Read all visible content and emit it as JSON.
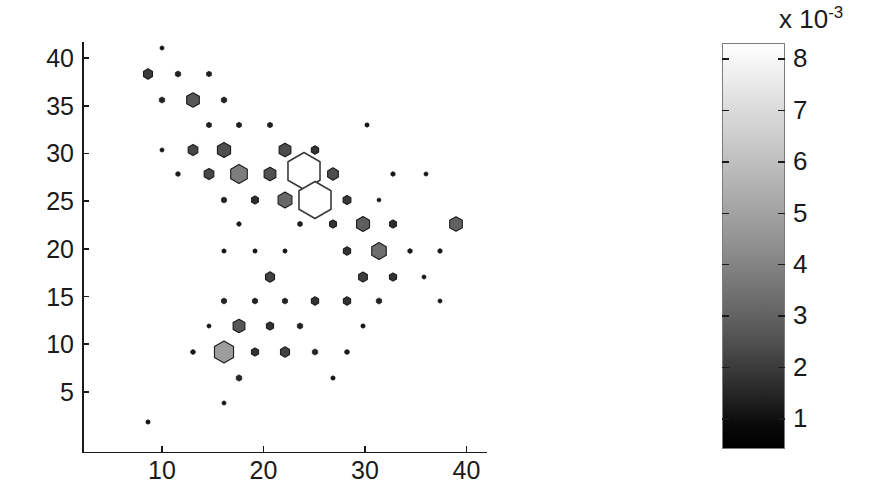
{
  "chart_data": {
    "type": "scatter",
    "subtype": "hexbin-density-scatter",
    "title": "",
    "xlabel": "",
    "ylabel": "",
    "xlim": [
      3.5,
      43.5
    ],
    "ylim": [
      1.5,
      41.5
    ],
    "xticks": [
      10,
      20,
      30,
      40
    ],
    "yticks": [
      5,
      10,
      15,
      20,
      25,
      30,
      35,
      40
    ],
    "grid": false,
    "legend": null,
    "marker": "hexagon",
    "value_units": "1e-3",
    "note": "Marker area encodes count/weight; marker gray level encodes density value from colorbar (black = low, white = high). Two largest bins are drawn as unfilled white hexagons with dark outline.",
    "colorbar": {
      "orientation": "vertical",
      "exponent_label": "x 10",
      "exponent_superscript": "-3",
      "ticks": [
        8,
        7,
        6,
        5,
        4,
        3,
        2,
        1
      ],
      "tick_labels": [
        "8",
        "7",
        "6",
        "5",
        "4",
        "3",
        "2",
        "1"
      ],
      "vmin": 0.4,
      "vmax": 8.3,
      "colormap": "gray",
      "low_color": "#000000",
      "high_color": "#ffffff"
    },
    "points": [
      {
        "x": 10.0,
        "y": 41.1,
        "r": 2.2,
        "v": 0.6
      },
      {
        "x": 8.6,
        "y": 38.3,
        "r": 5.2,
        "v": 1.6
      },
      {
        "x": 11.6,
        "y": 38.3,
        "r": 3.1,
        "v": 1.0
      },
      {
        "x": 14.6,
        "y": 38.3,
        "r": 2.8,
        "v": 0.9
      },
      {
        "x": 10.0,
        "y": 35.6,
        "r": 3.1,
        "v": 1.0
      },
      {
        "x": 13.1,
        "y": 35.6,
        "r": 7.3,
        "v": 2.4
      },
      {
        "x": 16.1,
        "y": 35.6,
        "r": 3.1,
        "v": 1.0
      },
      {
        "x": 14.6,
        "y": 33.0,
        "r": 2.8,
        "v": 0.9
      },
      {
        "x": 17.6,
        "y": 33.0,
        "r": 2.8,
        "v": 0.9
      },
      {
        "x": 20.6,
        "y": 33.0,
        "r": 2.8,
        "v": 0.9
      },
      {
        "x": 30.2,
        "y": 33.0,
        "r": 2.3,
        "v": 0.7
      },
      {
        "x": 10.0,
        "y": 30.4,
        "r": 2.2,
        "v": 0.7
      },
      {
        "x": 13.1,
        "y": 30.4,
        "r": 5.6,
        "v": 1.9
      },
      {
        "x": 16.1,
        "y": 30.4,
        "r": 7.6,
        "v": 2.2
      },
      {
        "x": 22.1,
        "y": 30.4,
        "r": 6.8,
        "v": 2.1
      },
      {
        "x": 25.1,
        "y": 30.4,
        "r": 4.2,
        "v": 1.4
      },
      {
        "x": 11.6,
        "y": 27.8,
        "r": 2.5,
        "v": 0.8
      },
      {
        "x": 14.6,
        "y": 27.8,
        "r": 5.6,
        "v": 1.9
      },
      {
        "x": 17.6,
        "y": 27.8,
        "r": 9.6,
        "v": 3.6
      },
      {
        "x": 20.6,
        "y": 27.8,
        "r": 6.8,
        "v": 2.2
      },
      {
        "x": 26.8,
        "y": 27.8,
        "r": 6.2,
        "v": 2.1
      },
      {
        "x": 32.8,
        "y": 27.8,
        "r": 2.4,
        "v": 0.8
      },
      {
        "x": 36.0,
        "y": 27.8,
        "r": 2.2,
        "v": 0.7
      },
      {
        "x": 16.1,
        "y": 25.1,
        "r": 3.0,
        "v": 1.0
      },
      {
        "x": 19.2,
        "y": 25.1,
        "r": 4.0,
        "v": 1.3
      },
      {
        "x": 22.1,
        "y": 25.1,
        "r": 8.0,
        "v": 2.9
      },
      {
        "x": 28.2,
        "y": 25.1,
        "r": 4.5,
        "v": 1.5
      },
      {
        "x": 31.4,
        "y": 25.1,
        "r": 2.1,
        "v": 0.7
      },
      {
        "x": 17.6,
        "y": 22.6,
        "r": 2.4,
        "v": 0.8
      },
      {
        "x": 23.6,
        "y": 22.6,
        "r": 2.7,
        "v": 0.9
      },
      {
        "x": 26.8,
        "y": 22.6,
        "r": 4.0,
        "v": 1.4
      },
      {
        "x": 29.8,
        "y": 22.6,
        "r": 7.5,
        "v": 2.6
      },
      {
        "x": 32.8,
        "y": 22.6,
        "r": 4.0,
        "v": 1.3
      },
      {
        "x": 39.0,
        "y": 22.6,
        "r": 7.3,
        "v": 2.7
      },
      {
        "x": 16.1,
        "y": 19.8,
        "r": 2.3,
        "v": 0.7
      },
      {
        "x": 19.2,
        "y": 19.8,
        "r": 2.3,
        "v": 0.7
      },
      {
        "x": 22.1,
        "y": 19.8,
        "r": 2.3,
        "v": 0.7
      },
      {
        "x": 28.2,
        "y": 19.8,
        "r": 4.2,
        "v": 1.4
      },
      {
        "x": 31.4,
        "y": 19.8,
        "r": 8.4,
        "v": 3.1
      },
      {
        "x": 34.4,
        "y": 19.8,
        "r": 2.5,
        "v": 0.8
      },
      {
        "x": 37.4,
        "y": 19.8,
        "r": 2.4,
        "v": 0.8
      },
      {
        "x": 20.6,
        "y": 17.1,
        "r": 5.2,
        "v": 1.8
      },
      {
        "x": 29.8,
        "y": 17.1,
        "r": 5.0,
        "v": 1.7
      },
      {
        "x": 32.8,
        "y": 17.1,
        "r": 4.1,
        "v": 1.4
      },
      {
        "x": 35.8,
        "y": 17.1,
        "r": 2.2,
        "v": 0.7
      },
      {
        "x": 16.1,
        "y": 14.5,
        "r": 3.0,
        "v": 1.0
      },
      {
        "x": 19.2,
        "y": 14.5,
        "r": 3.0,
        "v": 1.0
      },
      {
        "x": 22.1,
        "y": 14.5,
        "r": 3.0,
        "v": 1.0
      },
      {
        "x": 25.1,
        "y": 14.5,
        "r": 4.2,
        "v": 1.4
      },
      {
        "x": 28.2,
        "y": 14.5,
        "r": 4.2,
        "v": 1.4
      },
      {
        "x": 31.4,
        "y": 14.5,
        "r": 3.1,
        "v": 1.0
      },
      {
        "x": 37.4,
        "y": 14.5,
        "r": 2.2,
        "v": 0.7
      },
      {
        "x": 14.6,
        "y": 11.9,
        "r": 2.2,
        "v": 0.7
      },
      {
        "x": 17.6,
        "y": 11.9,
        "r": 6.8,
        "v": 2.4
      },
      {
        "x": 20.6,
        "y": 11.9,
        "r": 4.1,
        "v": 1.4
      },
      {
        "x": 23.6,
        "y": 11.9,
        "r": 3.1,
        "v": 1.0
      },
      {
        "x": 29.8,
        "y": 11.9,
        "r": 2.3,
        "v": 0.7
      },
      {
        "x": 13.1,
        "y": 9.2,
        "r": 2.6,
        "v": 0.8
      },
      {
        "x": 16.1,
        "y": 9.2,
        "r": 11.0,
        "v": 4.6
      },
      {
        "x": 19.2,
        "y": 9.2,
        "r": 4.1,
        "v": 1.4
      },
      {
        "x": 22.1,
        "y": 9.2,
        "r": 5.2,
        "v": 1.8
      },
      {
        "x": 25.1,
        "y": 9.2,
        "r": 3.1,
        "v": 1.0
      },
      {
        "x": 28.2,
        "y": 9.2,
        "r": 2.6,
        "v": 0.8
      },
      {
        "x": 17.6,
        "y": 6.5,
        "r": 3.2,
        "v": 1.1
      },
      {
        "x": 26.8,
        "y": 6.5,
        "r": 2.3,
        "v": 0.7
      },
      {
        "x": 16.1,
        "y": 3.8,
        "r": 2.2,
        "v": 0.7
      },
      {
        "x": 8.6,
        "y": 1.9,
        "r": 2.3,
        "v": 0.7
      }
    ],
    "outlined_points": [
      {
        "x": 24.0,
        "y": 28.2,
        "r": 18.5,
        "v": 7.9,
        "fill": "#ffffff",
        "stroke": "#3a3a3a"
      },
      {
        "x": 25.1,
        "y": 25.1,
        "r": 18.5,
        "v": 8.0,
        "fill": "#ffffff",
        "stroke": "#3a3a3a"
      }
    ]
  }
}
